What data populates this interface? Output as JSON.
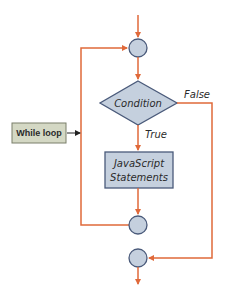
{
  "diagram": {
    "type": "flowchart",
    "title": "While loop",
    "colors": {
      "flow_line": "#e0693a",
      "node_fill": "#c5d0de",
      "node_stroke": "#4a5a7a",
      "label_box_fill": "#d4d8c4",
      "label_box_stroke": "#7a7f6a",
      "pointer_arrow": "#222222"
    },
    "nodes": [
      {
        "id": "entry-junction",
        "shape": "circle",
        "label": ""
      },
      {
        "id": "condition",
        "shape": "diamond",
        "label": "Condition"
      },
      {
        "id": "statements",
        "shape": "rectangle",
        "label_line1": "JavaScript",
        "label_line2": "Statements"
      },
      {
        "id": "loop-junction",
        "shape": "circle",
        "label": ""
      },
      {
        "id": "exit-junction",
        "shape": "circle",
        "label": ""
      }
    ],
    "edges": [
      {
        "from": "start",
        "to": "entry-junction",
        "label": ""
      },
      {
        "from": "entry-junction",
        "to": "condition",
        "label": ""
      },
      {
        "from": "condition",
        "to": "statements",
        "label": "True"
      },
      {
        "from": "condition",
        "to": "exit-junction",
        "label": "False"
      },
      {
        "from": "statements",
        "to": "loop-junction",
        "label": ""
      },
      {
        "from": "loop-junction",
        "to": "entry-junction",
        "label": ""
      },
      {
        "from": "exit-junction",
        "to": "end",
        "label": ""
      }
    ],
    "labels": {
      "condition": "Condition",
      "statements_line1": "JavaScript",
      "statements_line2": "Statements",
      "true_branch": "True",
      "false_branch": "False",
      "callout": "While loop"
    }
  }
}
